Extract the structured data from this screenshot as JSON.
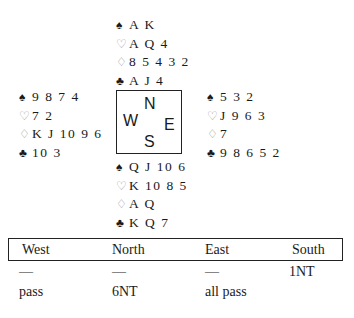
{
  "deal": {
    "north": {
      "spades": "A K",
      "hearts": "A Q 4",
      "diamonds": "8 5 4 3 2",
      "clubs": "A J 4"
    },
    "west": {
      "spades": "9 8 7 4",
      "hearts": "7 2",
      "diamonds": "K J 10 9 6",
      "clubs": "10 3"
    },
    "east": {
      "spades": "5 3 2",
      "hearts": "J 9 6 3",
      "diamonds": "7",
      "clubs": "9 8 6 5 2"
    },
    "south": {
      "spades": "Q J 10 6",
      "hearts": "K 10 8 5",
      "diamonds": "A Q",
      "clubs": "K Q 7"
    }
  },
  "suits": {
    "spades": "♠",
    "hearts": "♡",
    "diamonds": "♢",
    "clubs": "♣"
  },
  "compass": {
    "north": "N",
    "west": "W",
    "east": "E",
    "south": "S"
  },
  "auction": {
    "headers": [
      "West",
      "North",
      "East",
      "South"
    ],
    "rows": [
      [
        "—",
        "—",
        "—",
        "1NT"
      ],
      [
        "pass",
        "6NT",
        "all pass",
        ""
      ]
    ]
  }
}
